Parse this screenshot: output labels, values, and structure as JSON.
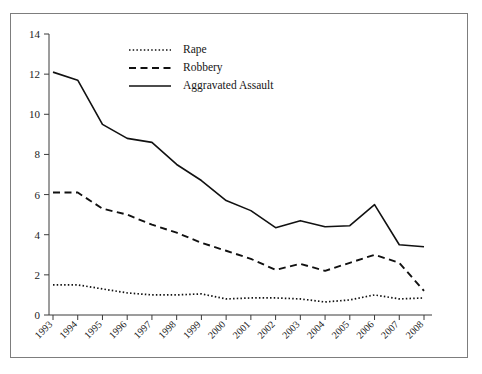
{
  "chart_data": {
    "type": "line",
    "title": "",
    "subtitle": "",
    "xlabel": "",
    "ylabel": "",
    "grid": false,
    "legend_position": "top-center",
    "xlim": [
      1993,
      2008
    ],
    "ylim": [
      0,
      14
    ],
    "yticks": [
      0,
      2,
      4,
      6,
      8,
      10,
      12,
      14
    ],
    "ytick_labels": [
      "0",
      "2",
      "4",
      "6",
      "8",
      "10",
      "12",
      "14"
    ],
    "categories": [
      1993,
      1994,
      1995,
      1996,
      1997,
      1998,
      1999,
      2000,
      2001,
      2002,
      2003,
      2004,
      2005,
      2006,
      2007,
      2008
    ],
    "xtick_labels": [
      "1993",
      "1994",
      "1995",
      "1996",
      "1997",
      "1998",
      "1999",
      "2000",
      "2001",
      "2002",
      "2003",
      "2004",
      "2005",
      "2006",
      "2007",
      "2008"
    ],
    "series": [
      {
        "name": "Rape",
        "style": "dotted",
        "color": "#111111",
        "values": [
          1.5,
          1.5,
          1.3,
          1.1,
          1.0,
          1.0,
          1.05,
          0.8,
          0.85,
          0.85,
          0.8,
          0.65,
          0.75,
          1.0,
          0.8,
          0.85
        ]
      },
      {
        "name": "Robbery",
        "style": "dashed",
        "color": "#111111",
        "values": [
          6.1,
          6.1,
          5.3,
          5.0,
          4.5,
          4.1,
          3.6,
          3.2,
          2.8,
          2.25,
          2.55,
          2.2,
          2.6,
          3.0,
          2.6,
          1.2
        ]
      },
      {
        "name": "Aggravated Assault",
        "style": "solid",
        "color": "#111111",
        "values": [
          12.1,
          11.7,
          9.5,
          8.8,
          8.6,
          7.5,
          6.7,
          5.7,
          5.2,
          4.35,
          4.7,
          4.4,
          4.45,
          5.5,
          3.5,
          3.4
        ]
      }
    ]
  },
  "legend": {
    "items": [
      {
        "label": "Rape",
        "style": "dotted"
      },
      {
        "label": "Robbery",
        "style": "dashed"
      },
      {
        "label": "Aggravated Assault",
        "style": "solid"
      }
    ]
  }
}
